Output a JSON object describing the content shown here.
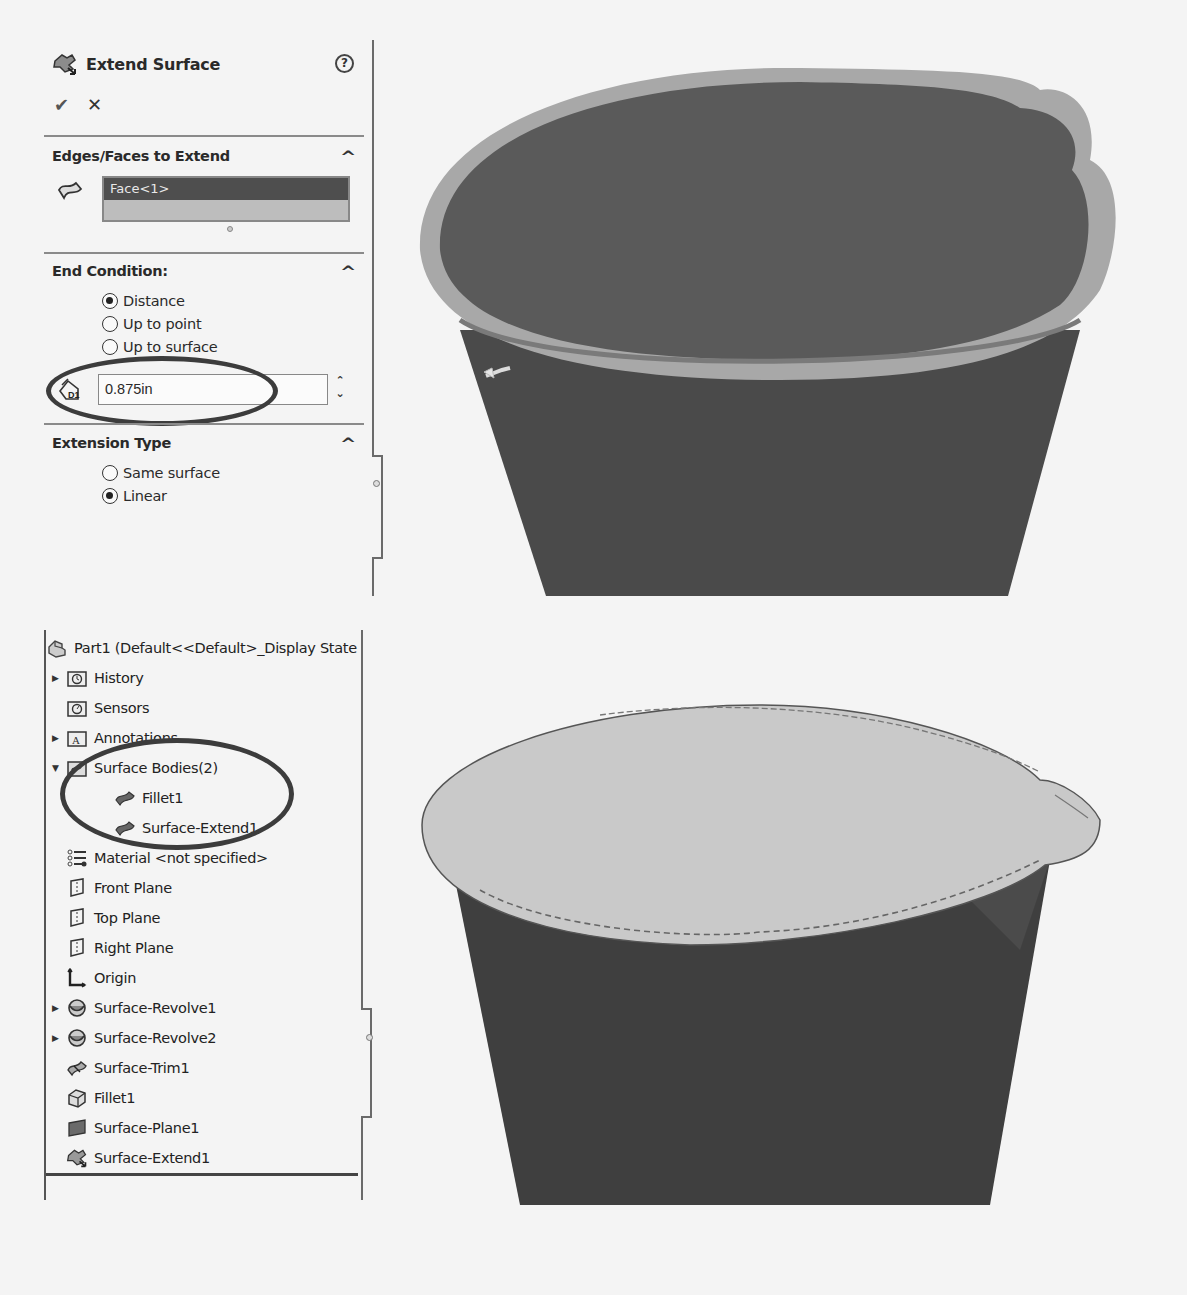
{
  "property_manager": {
    "title": "Extend Surface",
    "icon": "extend-surface-icon",
    "help_label": "?",
    "ok_label": "✔",
    "cancel_label": "✕",
    "sections": {
      "edges_faces": {
        "heading": "Edges/Faces to Extend",
        "icon": "face-selection-icon",
        "selections": [
          "Face<1>"
        ]
      },
      "end_condition": {
        "heading": "End Condition:",
        "options": [
          {
            "label": "Distance",
            "selected": true
          },
          {
            "label": "Up to point",
            "selected": false
          },
          {
            "label": "Up to surface",
            "selected": false
          }
        ],
        "distance_icon": "distance-d1-icon",
        "distance_value": "0.875in"
      },
      "extension_type": {
        "heading": "Extension Type",
        "options": [
          {
            "label": "Same surface",
            "selected": false
          },
          {
            "label": "Linear",
            "selected": true
          }
        ]
      }
    },
    "collapse_glyph": "^"
  },
  "feature_tree": {
    "root": "Part1  (Default<<Default>_Display State",
    "items": [
      {
        "label": "History",
        "icon": "history-folder-icon",
        "expander": "right"
      },
      {
        "label": "Sensors",
        "icon": "sensors-folder-icon",
        "expander": "none"
      },
      {
        "label": "Annotations",
        "icon": "annotations-folder-icon",
        "expander": "right"
      },
      {
        "label": "Surface Bodies(2)",
        "icon": "surface-bodies-folder-icon",
        "expander": "down"
      },
      {
        "label": "Fillet1",
        "icon": "surface-body-icon",
        "indent": 1
      },
      {
        "label": "Surface-Extend1",
        "icon": "surface-body-icon",
        "indent": 1
      },
      {
        "label": "Material <not specified>",
        "icon": "material-icon",
        "expander": "none"
      },
      {
        "label": "Front Plane",
        "icon": "plane-icon",
        "expander": "none"
      },
      {
        "label": "Top Plane",
        "icon": "plane-icon",
        "expander": "none"
      },
      {
        "label": "Right Plane",
        "icon": "plane-icon",
        "expander": "none"
      },
      {
        "label": "Origin",
        "icon": "origin-icon",
        "expander": "none"
      },
      {
        "label": "Surface-Revolve1",
        "icon": "surface-revolve-icon",
        "expander": "right"
      },
      {
        "label": "Surface-Revolve2",
        "icon": "surface-revolve-icon",
        "expander": "right"
      },
      {
        "label": "Surface-Trim1",
        "icon": "surface-trim-icon",
        "expander": "none"
      },
      {
        "label": "Fillet1",
        "icon": "fillet-icon",
        "expander": "none"
      },
      {
        "label": "Surface-Plane1",
        "icon": "surface-plane-icon",
        "expander": "none"
      },
      {
        "label": "Surface-Extend1",
        "icon": "extend-surface-icon",
        "expander": "none"
      }
    ]
  },
  "viewports": {
    "top": {
      "description": "Preview of extended face on cup top (0.875in linear extension)",
      "colors": {
        "body": "#4a4a4a",
        "face": "#5a5a5a",
        "extension": "#a9a9a9"
      }
    },
    "bottom": {
      "description": "Result: Surface-Extend1 lid with spout over cup body",
      "colors": {
        "body": "#3f3f3f",
        "lid": "#c9c9c9",
        "edge": "#6a6a6a"
      }
    }
  }
}
